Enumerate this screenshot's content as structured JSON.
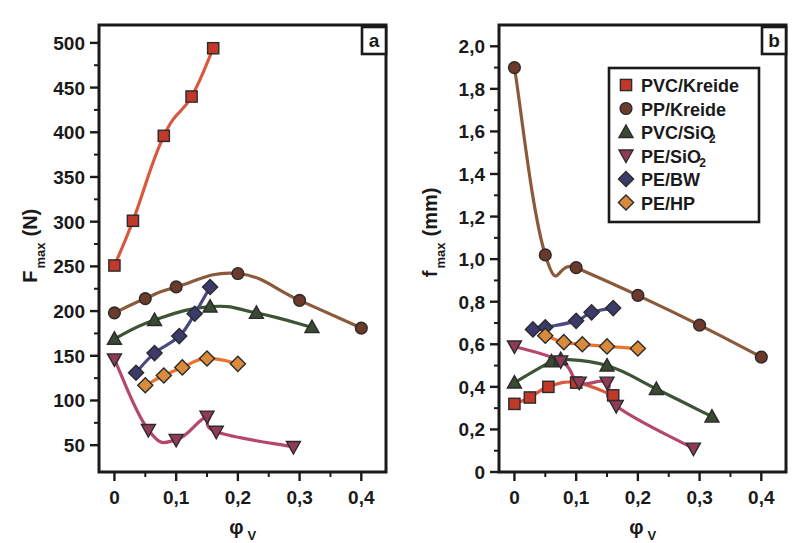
{
  "figure": {
    "width": 797,
    "height": 543,
    "background": "#ffffff"
  },
  "legend": {
    "position": "panel-b-top-right",
    "entries": [
      {
        "label": "PVC/Kreide",
        "label_sub": "",
        "marker": "square",
        "color": "#C0392B",
        "line_color": "#D9593F"
      },
      {
        "label": "PP/Kreide",
        "label_sub": "",
        "marker": "circle",
        "color": "#6B3A2A",
        "line_color": "#8A5A3B"
      },
      {
        "label": "PVC/SiO",
        "label_sub": "2",
        "marker": "triangle-up",
        "color": "#3A4A32",
        "line_color": "#3F5437"
      },
      {
        "label": "PE/SiO",
        "label_sub": "2",
        "marker": "triangle-down",
        "color": "#8E3A58",
        "line_color": "#B5476F"
      },
      {
        "label": "PE/BW",
        "label_sub": "",
        "marker": "diamond",
        "color": "#3B3A6B",
        "line_color": "#4A4980"
      },
      {
        "label": "PE/HP",
        "label_sub": "",
        "marker": "diamond",
        "color": "#D98A3A",
        "line_color": "#E8742F"
      }
    ]
  },
  "chart_data": [
    {
      "panel": "a",
      "tag": "a",
      "type": "scatter",
      "title": "",
      "xlabel": "φ",
      "xlabel_sub": "V",
      "ylabel": "F",
      "ylabel_sub": "max",
      "ylabel_units": "(N)",
      "xlim": [
        -0.025,
        0.44
      ],
      "ylim": [
        20,
        520
      ],
      "xticks": [
        0,
        0.1,
        0.2,
        0.3,
        0.4
      ],
      "xticklabels": [
        "0",
        "0,1",
        "0,2",
        "0,3",
        "0,4"
      ],
      "xminorticks": [
        0.05,
        0.15,
        0.25,
        0.35
      ],
      "yticks": [
        50,
        100,
        150,
        200,
        250,
        300,
        350,
        400,
        450,
        500
      ],
      "yticklabels": [
        "50",
        "100",
        "150",
        "200",
        "250",
        "300",
        "350",
        "400",
        "450",
        "500"
      ],
      "yminorticks": [
        75,
        125,
        175,
        225,
        275,
        325,
        375,
        425,
        475
      ],
      "grid": false,
      "series": [
        {
          "name": "PVC/Kreide",
          "marker": "square",
          "color": "#C0392B",
          "line_color": "#D9593F",
          "x": [
            0.0,
            0.03,
            0.08,
            0.125,
            0.16
          ],
          "y": [
            251,
            301,
            396,
            440,
            494
          ]
        },
        {
          "name": "PP/Kreide",
          "marker": "circle",
          "color": "#6B3A2A",
          "line_color": "#8A5A3B",
          "x": [
            0.0,
            0.05,
            0.1,
            0.2,
            0.3,
            0.4
          ],
          "y": [
            198,
            214,
            227,
            242,
            212,
            181
          ]
        },
        {
          "name": "PVC/SiO2",
          "marker": "triangle-up",
          "color": "#3A4A32",
          "line_color": "#3F5437",
          "x": [
            0.0,
            0.065,
            0.155,
            0.23,
            0.32
          ],
          "y": [
            169,
            190,
            205,
            198,
            182
          ]
        },
        {
          "name": "PE/SiO2",
          "marker": "triangle-down",
          "color": "#8E3A58",
          "line_color": "#B5476F",
          "x": [
            0.0,
            0.055,
            0.1,
            0.15,
            0.165,
            0.29
          ],
          "y": [
            146,
            67,
            56,
            82,
            65,
            48
          ]
        },
        {
          "name": "PE/BW",
          "marker": "diamond",
          "color": "#3B3A6B",
          "line_color": "#4A4980",
          "x": [
            0.035,
            0.065,
            0.105,
            0.13,
            0.155
          ],
          "y": [
            131,
            153,
            172,
            197,
            227
          ]
        },
        {
          "name": "PE/HP",
          "marker": "diamond",
          "color": "#D98A3A",
          "line_color": "#E8742F",
          "x": [
            0.05,
            0.08,
            0.11,
            0.15,
            0.2
          ],
          "y": [
            117,
            128,
            137,
            147,
            141
          ]
        }
      ]
    },
    {
      "panel": "b",
      "tag": "b",
      "type": "scatter",
      "title": "",
      "xlabel": "φ",
      "xlabel_sub": "V",
      "ylabel": "f",
      "ylabel_sub": "max",
      "ylabel_units": "(mm)",
      "xlim": [
        -0.025,
        0.44
      ],
      "ylim": [
        0,
        2.1
      ],
      "xticks": [
        0,
        0.1,
        0.2,
        0.3,
        0.4
      ],
      "xticklabels": [
        "0",
        "0,1",
        "0,2",
        "0,3",
        "0,4"
      ],
      "xminorticks": [
        0.05,
        0.15,
        0.25,
        0.35
      ],
      "yticks": [
        0,
        0.2,
        0.4,
        0.6,
        0.8,
        1.0,
        1.2,
        1.4,
        1.6,
        1.8,
        2.0
      ],
      "yticklabels": [
        "0",
        "0,2",
        "0,4",
        "0,6",
        "0,8",
        "1,0",
        "1,2",
        "1,4",
        "1,6",
        "1,8",
        "2,0"
      ],
      "yminorticks": [
        0.1,
        0.3,
        0.5,
        0.7,
        0.9,
        1.1,
        1.3,
        1.5,
        1.7,
        1.9
      ],
      "grid": false,
      "series": [
        {
          "name": "PVC/Kreide",
          "marker": "square",
          "color": "#C0392B",
          "line_color": "#D9593F",
          "x": [
            0.0,
            0.025,
            0.055,
            0.1,
            0.16
          ],
          "y": [
            0.32,
            0.35,
            0.4,
            0.42,
            0.36
          ]
        },
        {
          "name": "PP/Kreide",
          "marker": "circle",
          "color": "#6B3A2A",
          "line_color": "#8A5A3B",
          "x": [
            0.0,
            0.05,
            0.1,
            0.2,
            0.3,
            0.4
          ],
          "y": [
            1.9,
            1.02,
            0.96,
            0.83,
            0.69,
            0.54
          ]
        },
        {
          "name": "PVC/SiO2",
          "marker": "triangle-up",
          "color": "#3A4A32",
          "line_color": "#3F5437",
          "x": [
            0.0,
            0.06,
            0.075,
            0.15,
            0.23,
            0.32
          ],
          "y": [
            0.42,
            0.52,
            0.53,
            0.5,
            0.39,
            0.26
          ]
        },
        {
          "name": "PE/SiO2",
          "marker": "triangle-down",
          "color": "#8E3A58",
          "line_color": "#B5476F",
          "x": [
            0.0,
            0.075,
            0.105,
            0.15,
            0.165,
            0.29
          ],
          "y": [
            0.59,
            0.52,
            0.42,
            0.42,
            0.31,
            0.11
          ]
        },
        {
          "name": "PE/BW",
          "marker": "diamond",
          "color": "#3B3A6B",
          "line_color": "#4A4980",
          "x": [
            0.03,
            0.05,
            0.1,
            0.125,
            0.16
          ],
          "y": [
            0.67,
            0.68,
            0.71,
            0.75,
            0.77
          ]
        },
        {
          "name": "PE/HP",
          "marker": "diamond",
          "color": "#D98A3A",
          "line_color": "#E8742F",
          "x": [
            0.05,
            0.08,
            0.11,
            0.15,
            0.2
          ],
          "y": [
            0.64,
            0.61,
            0.6,
            0.59,
            0.58
          ]
        }
      ]
    }
  ]
}
